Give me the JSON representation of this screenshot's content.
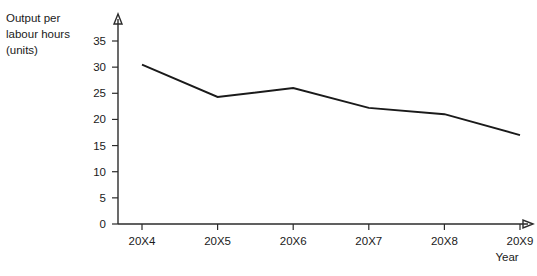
{
  "chart_data": {
    "type": "line",
    "title": "",
    "ylabel": "Output per\nlabour hours\n(units)",
    "xlabel": "Year",
    "categories": [
      "20X4",
      "20X5",
      "20X6",
      "20X7",
      "20X8",
      "20X9"
    ],
    "values": [
      30.5,
      24.3,
      26,
      22.2,
      21,
      17
    ],
    "series": [
      {
        "name": "Output per labour hours (units)",
        "values": [
          30.5,
          24.3,
          26,
          22.2,
          21,
          17
        ]
      }
    ],
    "ylim": [
      0,
      35
    ],
    "yticks": [
      0,
      5,
      10,
      15,
      20,
      25,
      30,
      35
    ],
    "ytick_labels": [
      "0",
      "5",
      "10",
      "15",
      "20",
      "25",
      "30",
      "35"
    ],
    "xtick_labels": [
      "20X4",
      "20X5",
      "20X6",
      "20X7",
      "20X8",
      "20X9"
    ],
    "grid": false,
    "legend": false,
    "legend_position": "none",
    "line_color": "#1a1a1a",
    "axis_color": "#2b2b2b"
  },
  "axis_titles": {
    "y_line1": "Output per",
    "y_line2": "labour hours",
    "y_line3": "(units)",
    "x": "Year"
  }
}
